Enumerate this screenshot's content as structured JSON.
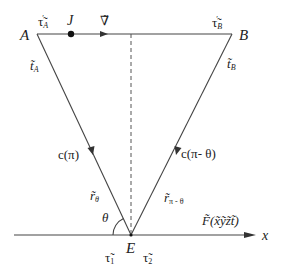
{
  "diagram": {
    "type": "geometric-ray-diagram",
    "points": {
      "A": {
        "label": "A",
        "x": 37,
        "y": 34
      },
      "B": {
        "label": "B",
        "x": 232,
        "y": 34
      },
      "E": {
        "label": "E",
        "x": 131,
        "y": 235
      },
      "J": {
        "label": "J",
        "x": 71,
        "y": 34
      }
    },
    "labels": {
      "tau_A_prime": "τ̃′A",
      "tau_A_prime_main": "τ̃",
      "tau_A_prime_sub": "A",
      "J": "J",
      "nabla": "∇̃",
      "tau_B_prime_main": "τ̃",
      "tau_B_prime_sub": "B",
      "B": "B",
      "A": "A",
      "t_A_main": "t̃",
      "t_A_sub": "A",
      "t_B_main": "t̃",
      "t_B_sub": "B",
      "c_pi": "c(π)",
      "c_pi_minus_theta": "c(π- θ)",
      "r_theta_main": "r̃",
      "r_theta_sub": "θ",
      "r_pi_minus_theta_main": "r̃",
      "r_pi_minus_theta_sub": "π - θ",
      "theta": "θ",
      "E": "E",
      "tau_1_main": "τ̃",
      "tau_1_sub": "1",
      "tau_2_main": "τ̃",
      "tau_2_sub": "2",
      "F_field": "F̃(x̃ỹz̃t̃)",
      "x_axis": "x"
    },
    "colors": {
      "line": "#444444",
      "text": "#222222",
      "background": "#ffffff"
    }
  }
}
